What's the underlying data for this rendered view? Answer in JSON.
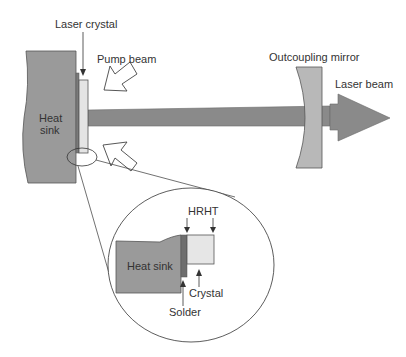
{
  "diagram": {
    "type": "thin-disk laser schematic",
    "labels": {
      "laser_crystal": "Laser crystal",
      "pump_beam": "Pump beam",
      "outcoupling_mirror": "Outcoupling mirror",
      "laser_beam": "Laser beam",
      "heat_sink_line1": "Heat",
      "heat_sink_line2": "sink"
    },
    "inset": {
      "hrht": "HRHT",
      "heat_sink": "Heat sink",
      "crystal": "Crystal",
      "solder": "Solder"
    },
    "colors": {
      "heat_sink": "#9a9a9a",
      "beam": "#8a8a8a",
      "mirror": "#b5b5b5",
      "crystal": "#e6e6e6",
      "solder": "#6e6e6e",
      "outline": "#444444"
    }
  }
}
